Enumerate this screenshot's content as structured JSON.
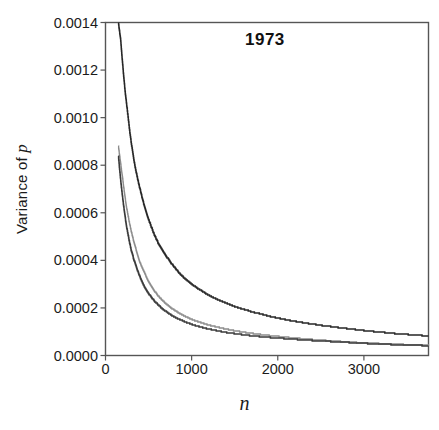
{
  "chart_data": {
    "type": "line",
    "title": "1973",
    "xlabel": "n",
    "ylabel": "Variance of p",
    "xlim": [
      0,
      3750
    ],
    "ylim": [
      0,
      0.0014
    ],
    "xticks": [
      0,
      1000,
      2000,
      3000
    ],
    "xtick_labels": [
      "0",
      "1000",
      "2000",
      "3000"
    ],
    "yticks": [
      0.0,
      0.0002,
      0.0004,
      0.0006,
      0.0008,
      0.001,
      0.0012,
      0.0014
    ],
    "ytick_labels": [
      "0.0000",
      "0.0002",
      "0.0004",
      "0.0006",
      "0.0008",
      "0.0010",
      "0.0012",
      "0.0014"
    ],
    "grid": false,
    "legend": "none",
    "annotations": [
      {
        "text": "1973",
        "x": 1900,
        "y": 0.00133
      }
    ],
    "series": [
      {
        "name": "upper-curve",
        "color": "#262626",
        "x": [
          150,
          175,
          200,
          225,
          250,
          300,
          350,
          400,
          450,
          500,
          600,
          700,
          800,
          900,
          1000,
          1100,
          1200,
          1300,
          1400,
          1500,
          1600,
          1800,
          2000,
          2200,
          2400,
          2600,
          2800,
          3000,
          3200,
          3400,
          3600,
          3750
        ],
        "y": [
          0.0014,
          0.00133,
          0.00122,
          0.00112,
          0.00104,
          0.00089,
          0.00078,
          0.0007,
          0.00063,
          0.00057,
          0.00048,
          0.00042,
          0.00037,
          0.00033,
          0.0003,
          0.000275,
          0.000253,
          0.000235,
          0.00022,
          0.000206,
          0.000194,
          0.000174,
          0.000157,
          0.000143,
          0.000132,
          0.000122,
          0.000113,
          0.000105,
          9.8e-05,
          9.1e-05,
          8.6e-05,
          8.2e-05
        ]
      },
      {
        "name": "middle-curve",
        "color": "#8c8c8c",
        "x": [
          150,
          175,
          200,
          225,
          250,
          300,
          350,
          400,
          450,
          500,
          600,
          700,
          800,
          900,
          1000,
          1100,
          1200,
          1300,
          1400,
          1500,
          1600,
          1800,
          2000,
          2200,
          2400,
          2600,
          2800,
          3000,
          3200,
          3400,
          3600,
          3750
        ],
        "y": [
          0.00088,
          0.00081,
          0.00074,
          0.00067,
          0.00061,
          0.00052,
          0.00045,
          0.00039,
          0.00035,
          0.00031,
          0.000255,
          0.000218,
          0.00019,
          0.000169,
          0.000152,
          0.000139,
          0.000128,
          0.000119,
          0.000111,
          0.000104,
          9.8e-05,
          8.8e-05,
          8e-05,
          7.3e-05,
          6.7e-05,
          6.2e-05,
          5.7e-05,
          5.3e-05,
          5e-05,
          4.7e-05,
          4.4e-05,
          4.2e-05
        ]
      },
      {
        "name": "lower-curve",
        "color": "#3a3a3a",
        "x": [
          150,
          175,
          200,
          225,
          250,
          300,
          350,
          400,
          450,
          500,
          600,
          700,
          800,
          900,
          1000,
          1100,
          1200,
          1300,
          1400,
          1500,
          1600,
          1800,
          2000,
          2200,
          2400,
          2600,
          2800,
          3000,
          3200,
          3400,
          3600,
          3750
        ],
        "y": [
          0.00084,
          0.00074,
          0.00066,
          0.00059,
          0.00053,
          0.00044,
          0.00038,
          0.00033,
          0.00029,
          0.00026,
          0.000216,
          0.000185,
          0.000162,
          0.000145,
          0.000131,
          0.00012,
          0.000111,
          0.000104,
          9.7e-05,
          9.2e-05,
          8.7e-05,
          7.9e-05,
          7.3e-05,
          6.8e-05,
          6.3e-05,
          5.9e-05,
          5.5e-05,
          5.1e-05,
          4.8e-05,
          4.5e-05,
          4.3e-05,
          4.1e-05
        ]
      }
    ]
  },
  "axes": {
    "frame_color": "#555555"
  }
}
